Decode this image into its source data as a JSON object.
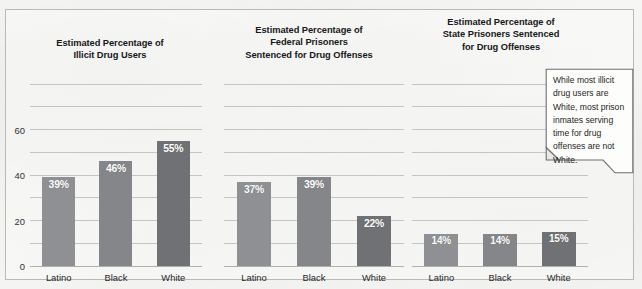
{
  "figure": {
    "callout": {
      "text": "While most illicit drug users are White, most prison inmates serving time for drug offenses are not White."
    }
  },
  "chart_data": [
    {
      "type": "bar",
      "title": "Estimated Percentage of Illicit Drug Users",
      "title_lines": [
        "Estimated Percentage of",
        "Illicit Drug Users"
      ],
      "categories": [
        "Latino",
        "Black",
        "White"
      ],
      "values": [
        39,
        46,
        55
      ],
      "value_labels": [
        "39%",
        "46%",
        "55%"
      ],
      "xlabel": "",
      "ylabel": "",
      "ylim": [
        0,
        80
      ],
      "yticks": [
        0,
        20,
        40,
        60
      ],
      "ytick_labels": [
        "0",
        "20",
        "40",
        "60"
      ],
      "gridlines": [
        0,
        10,
        20,
        30,
        40,
        50,
        60,
        70,
        80
      ],
      "grid": true,
      "legend": "none",
      "bar_colors": [
        "#8e9093",
        "#84868a",
        "#6f7174"
      ]
    },
    {
      "type": "bar",
      "title": "Estimated Percentage of Federal Prisoners Sentenced for Drug Offenses",
      "title_lines": [
        "Estimated Percentage of",
        "Federal Prisoners",
        "Sentenced for Drug Offenses"
      ],
      "categories": [
        "Latino",
        "Black",
        "White"
      ],
      "values": [
        37,
        39,
        22
      ],
      "value_labels": [
        "37%",
        "39%",
        "22%"
      ],
      "xlabel": "",
      "ylabel": "",
      "ylim": [
        0,
        80
      ],
      "yticks": [],
      "ytick_labels": [],
      "gridlines": [
        0,
        10,
        20,
        30,
        40,
        50,
        60,
        70,
        80
      ],
      "grid": true,
      "legend": "none",
      "bar_colors": [
        "#8e9093",
        "#84868a",
        "#6f7174"
      ]
    },
    {
      "type": "bar",
      "title": "Estimated Percentage of State Prisoners Sentenced for Drug Offenses",
      "title_lines": [
        "Estimated Percentage of",
        "State Prisoners Sentenced",
        "for Drug Offenses"
      ],
      "categories": [
        "Latino",
        "Black",
        "White"
      ],
      "values": [
        14,
        14,
        15
      ],
      "value_labels": [
        "14%",
        "14%",
        "15%"
      ],
      "xlabel": "",
      "ylabel": "",
      "ylim": [
        0,
        80
      ],
      "yticks": [],
      "ytick_labels": [],
      "gridlines": [
        0,
        10,
        20,
        30,
        40,
        50,
        60,
        70,
        80
      ],
      "grid": true,
      "legend": "none",
      "bar_colors": [
        "#8e9093",
        "#84868a",
        "#6f7174"
      ]
    }
  ]
}
